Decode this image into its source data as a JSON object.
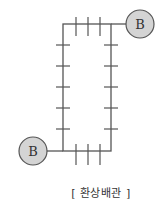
{
  "diagram": {
    "title": "[ 환상배관 ]",
    "colors": {
      "pipe": "#555555",
      "node_fill": "#d4d4d4",
      "node_stroke": "#555555",
      "text": "#333333"
    },
    "nodes": [
      {
        "id": "top-right",
        "label": "B"
      },
      {
        "id": "bottom-left",
        "label": "B"
      }
    ],
    "loop": {
      "shape": "rectangle",
      "top_ticks": 3,
      "bottom_ticks": 3,
      "left_ticks": 5,
      "right_ticks": 5
    }
  }
}
